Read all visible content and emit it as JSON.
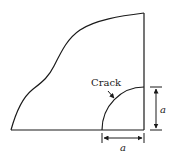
{
  "diagram": {
    "crack_label": "Crack",
    "vertical_dimension_label": "a",
    "horizontal_dimension_label": "a",
    "line_color": "#1a1a1a"
  }
}
